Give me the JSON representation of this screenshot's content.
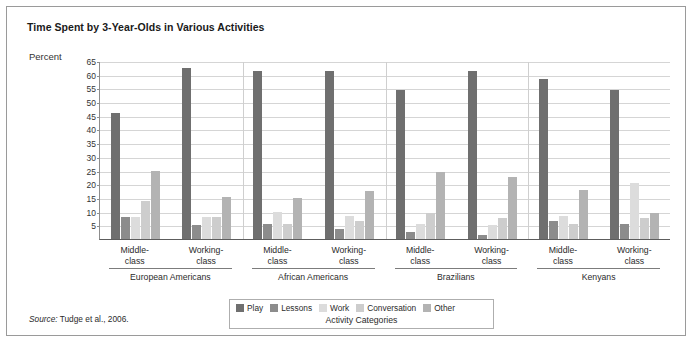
{
  "figure": {
    "title": "Time Spent by 3-Year-Olds in Various Activities",
    "axis_title": "Percent",
    "legend_title": "Activity Categories",
    "source_prefix": "Source:",
    "source_text": " Tudge et al., 2006."
  },
  "chart_data": {
    "type": "bar",
    "title": "Time Spent by 3-Year-Olds in Various Activities",
    "xlabel": "Activity Categories",
    "ylabel": "Percent",
    "ylim": [
      0,
      65
    ],
    "yticks": [
      5,
      10,
      15,
      20,
      25,
      30,
      35,
      40,
      45,
      50,
      55,
      60,
      65
    ],
    "grid": true,
    "legend_position": "bottom",
    "categories": [
      "European Americans / Middle-class",
      "European Americans / Working-class",
      "African Americans / Middle-class",
      "African Americans / Working-class",
      "Brazilians / Middle-class",
      "Brazilians / Working-class",
      "Kenyans / Middle-class",
      "Kenyans / Working-class"
    ],
    "groups": [
      {
        "name": "European Americans",
        "subgroups": [
          {
            "label_line1": "Middle-",
            "label_line2": "class",
            "values": [
              46,
              8,
              8,
              14,
              25
            ]
          },
          {
            "label_line1": "Working-",
            "label_line2": "class",
            "values": [
              62.5,
              5,
              8,
              8,
              15.5
            ]
          }
        ]
      },
      {
        "name": "African Americans",
        "subgroups": [
          {
            "label_line1": "Middle-",
            "label_line2": "class",
            "values": [
              61.5,
              5.5,
              10,
              5.5,
              15
            ]
          },
          {
            "label_line1": "Working-",
            "label_line2": "class",
            "values": [
              61.5,
              3.5,
              8.5,
              6.5,
              17.5
            ]
          }
        ]
      },
      {
        "name": "Brazilians",
        "subgroups": [
          {
            "label_line1": "Middle-",
            "label_line2": "class",
            "values": [
              54.5,
              2.5,
              5.5,
              9.5,
              24.5
            ]
          },
          {
            "label_line1": "Working-",
            "label_line2": "class",
            "values": [
              61.5,
              1.5,
              5,
              7.5,
              22.5
            ]
          }
        ]
      },
      {
        "name": "Kenyans",
        "subgroups": [
          {
            "label_line1": "Middle-",
            "label_line2": "class",
            "values": [
              58.5,
              6.5,
              8.5,
              5.5,
              18
            ]
          },
          {
            "label_line1": "Working-",
            "label_line2": "class",
            "values": [
              54.5,
              5.5,
              20.5,
              7.5,
              9.5
            ]
          }
        ]
      }
    ],
    "series": [
      {
        "name": "Play",
        "color": "#6f6f6f",
        "values": [
          46,
          62.5,
          61.5,
          61.5,
          54.5,
          61.5,
          58.5,
          54.5
        ]
      },
      {
        "name": "Lessons",
        "color": "#8c8c8c",
        "values": [
          8,
          5,
          5.5,
          3.5,
          2.5,
          1.5,
          6.5,
          5.5
        ]
      },
      {
        "name": "Work",
        "color": "#dcdcdc",
        "values": [
          8,
          8,
          10,
          8.5,
          5.5,
          5,
          8.5,
          20.5
        ]
      },
      {
        "name": "Conversation",
        "color": "#cdcdcd",
        "values": [
          14,
          8,
          5.5,
          6.5,
          9.5,
          7.5,
          5.5,
          7.5
        ]
      },
      {
        "name": "Other",
        "color": "#b3b3b3",
        "values": [
          25,
          15.5,
          15,
          17.5,
          24.5,
          22.5,
          18,
          9.5
        ]
      }
    ]
  }
}
